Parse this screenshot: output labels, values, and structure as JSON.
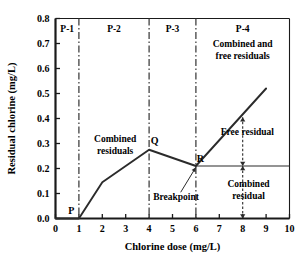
{
  "chart_data": {
    "type": "line",
    "title": "",
    "xlabel": "Chlorine dose (mg/L)",
    "ylabel": "Residual chlorine (mg/L)",
    "xlim": [
      0,
      10
    ],
    "ylim": [
      0.0,
      0.8
    ],
    "grid": false,
    "legend": "none",
    "xticks": [
      "0",
      "1",
      "2",
      "3",
      "4",
      "5",
      "6",
      "7",
      "8",
      "9",
      "10"
    ],
    "xtick_values": [
      0,
      1,
      2,
      3,
      4,
      5,
      6,
      7,
      8,
      9,
      10
    ],
    "yticks": [
      "0.0",
      "0.1",
      "0.2",
      "0.3",
      "0.4",
      "0.5",
      "0.6",
      "0.7",
      "0.8"
    ],
    "ytick_values": [
      0.0,
      0.1,
      0.2,
      0.3,
      0.4,
      0.5,
      0.6,
      0.7,
      0.8
    ],
    "series": [
      {
        "name": "Breakpoint chlorination curve",
        "x": [
          0,
          1,
          2,
          4,
          6,
          9
        ],
        "values": [
          0.0,
          0.0,
          0.145,
          0.275,
          0.21,
          0.52
        ]
      },
      {
        "name": "Combined residual level",
        "x": [
          6,
          10
        ],
        "values": [
          0.21,
          0.21
        ]
      }
    ],
    "region_dividers": [
      1,
      4,
      6
    ],
    "regions": [
      {
        "label": "P-1",
        "x_center": 0.5
      },
      {
        "label": "P-2",
        "x_center": 2.5
      },
      {
        "label": "P-3",
        "x_center": 5.0
      },
      {
        "label": "P-4",
        "x_center": 8.0
      }
    ],
    "points": [
      {
        "label": "P",
        "x": 1,
        "y": 0.0
      },
      {
        "label": "Q",
        "x": 4,
        "y": 0.275
      },
      {
        "label": "R",
        "x": 6,
        "y": 0.21
      }
    ],
    "annotations": [
      {
        "name": "combined-and-free-residuals",
        "text_line1": "Combined and",
        "text_line2": "free residuals",
        "x": 8.0,
        "y": 0.685
      },
      {
        "name": "combined-residuals",
        "text_line1": "Combined",
        "text_line2": "residuals",
        "x": 2.55,
        "y": 0.305
      },
      {
        "name": "free-residual",
        "text": "Free residual",
        "x": 8.2,
        "y": 0.335
      },
      {
        "name": "combined-residual",
        "text_line1": "Combined",
        "text_line2": "residual",
        "x": 8.25,
        "y": 0.125
      },
      {
        "name": "breakpoint",
        "text": "Breakpoint",
        "x": 5.15,
        "y": 0.075
      }
    ],
    "arrows": [
      {
        "name": "free-residual-arrow",
        "x": 8,
        "y_from": 0.21,
        "y_to": 0.405,
        "double": true
      },
      {
        "name": "combined-residual-arrow",
        "x": 8,
        "y_from": 0.0,
        "y_to": 0.21,
        "double": true
      },
      {
        "name": "breakpoint-leader",
        "from_x": 5.35,
        "from_y": 0.105,
        "to_x": 6.0,
        "to_y": 0.205
      }
    ],
    "colors": {
      "axis": "#1a1a1a",
      "curve": "#2b2b2b",
      "divider": "#3a3a3a",
      "text": "#000000",
      "background": "#ffffff"
    }
  }
}
